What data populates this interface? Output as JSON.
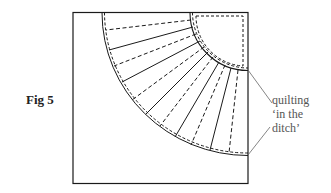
{
  "figure": {
    "label": "Fig 5",
    "annotation_lines": [
      "quilting",
      "‘in the",
      "ditch’"
    ],
    "colors": {
      "line": "#1a1a1a",
      "annotation_text": "#555555",
      "background": "#ffffff"
    }
  }
}
